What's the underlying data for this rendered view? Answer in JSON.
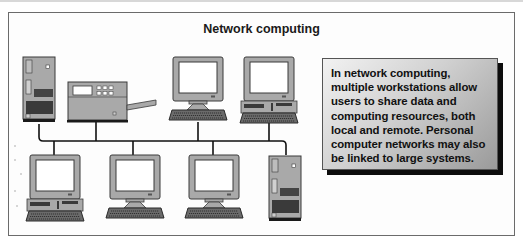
{
  "figure": {
    "title": "Network computing",
    "caption_box": {
      "text": "In network computing, multiple workstations allow users to share data and computing resources, both local and remote. Personal computer networks may also be linked to large systems."
    },
    "devices": [
      {
        "type": "tower-computer",
        "position": "top-left",
        "icon": "server-tower-icon"
      },
      {
        "type": "printer",
        "position": "top",
        "icon": "printer-icon"
      },
      {
        "type": "workstation-monitor",
        "position": "top",
        "icon": "monitor-icon"
      },
      {
        "type": "desktop-workstation",
        "position": "top",
        "icon": "desktop-computer-icon"
      },
      {
        "type": "desktop-workstation",
        "position": "bottom-left",
        "icon": "desktop-computer-icon"
      },
      {
        "type": "workstation-monitor",
        "position": "bottom",
        "icon": "monitor-icon"
      },
      {
        "type": "workstation-monitor",
        "position": "bottom",
        "icon": "monitor-icon"
      },
      {
        "type": "tower-computer",
        "position": "bottom-right",
        "icon": "server-tower-icon"
      }
    ],
    "colors": {
      "device_body": "#a9a9a9",
      "device_dark": "#3a3a3a",
      "screen": "#ffffff",
      "network_line": "#111111",
      "box_shadow": "#0d0d0d"
    }
  }
}
